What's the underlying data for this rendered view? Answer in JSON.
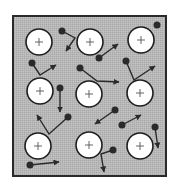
{
  "diagram": {
    "colors": {
      "background": "#ffffff",
      "lattice_fill": "#b4b4b4",
      "border": "#2a2a2a",
      "ion_fill": "#ffffff",
      "ion_stroke": "#1e1e1e",
      "electron": "#2a2a2a",
      "arrow": "#2a2a2a"
    },
    "frame": {
      "x": 13,
      "y": 16,
      "width": 153,
      "height": 160
    },
    "ion_symbol": "+",
    "ion_radius": 13,
    "ions": [
      {
        "id": "ion-1",
        "cx": 39,
        "cy": 42
      },
      {
        "id": "ion-2",
        "cx": 90,
        "cy": 42
      },
      {
        "id": "ion-3",
        "cx": 141,
        "cy": 40
      },
      {
        "id": "ion-4",
        "cx": 40,
        "cy": 91
      },
      {
        "id": "ion-5",
        "cx": 89,
        "cy": 94
      },
      {
        "id": "ion-6",
        "cx": 140,
        "cy": 93
      },
      {
        "id": "ion-7",
        "cx": 38,
        "cy": 146
      },
      {
        "id": "ion-8",
        "cx": 89,
        "cy": 145
      },
      {
        "id": "ion-9",
        "cx": 140,
        "cy": 146
      }
    ],
    "electron_radius": 3.5,
    "electrons": [
      {
        "id": "e-1",
        "x": 62,
        "y": 31,
        "path": [
          [
            62,
            31
          ],
          [
            75,
            38
          ],
          [
            66,
            51
          ]
        ]
      },
      {
        "id": "e-2",
        "x": 157,
        "y": 25,
        "path": []
      },
      {
        "id": "e-3",
        "x": 99,
        "y": 58,
        "path": [
          [
            99,
            58
          ],
          [
            118,
            44
          ]
        ]
      },
      {
        "id": "e-4",
        "x": 32,
        "y": 63,
        "path": [
          [
            32,
            63
          ],
          [
            40,
            75
          ],
          [
            56,
            65
          ]
        ]
      },
      {
        "id": "e-5",
        "x": 80,
        "y": 68,
        "path": [
          [
            80,
            68
          ],
          [
            97,
            81
          ],
          [
            119,
            82
          ]
        ]
      },
      {
        "id": "e-6",
        "x": 126,
        "y": 61,
        "path": [
          [
            126,
            61
          ],
          [
            134,
            80
          ],
          [
            155,
            66
          ]
        ]
      },
      {
        "id": "e-7",
        "x": 60,
        "y": 88,
        "path": [
          [
            60,
            88
          ],
          [
            60,
            112
          ]
        ]
      },
      {
        "id": "e-8",
        "x": 115,
        "y": 110,
        "path": [
          [
            115,
            110
          ],
          [
            95,
            124
          ]
        ]
      },
      {
        "id": "e-9",
        "x": 68,
        "y": 117,
        "path": [
          [
            68,
            117
          ],
          [
            49,
            134
          ],
          [
            37,
            115
          ]
        ]
      },
      {
        "id": "e-10",
        "x": 122,
        "y": 125,
        "path": [
          [
            122,
            125
          ],
          [
            141,
            115
          ]
        ]
      },
      {
        "id": "e-11",
        "x": 155,
        "y": 127,
        "path": [
          [
            155,
            127
          ],
          [
            158,
            148
          ]
        ]
      },
      {
        "id": "e-12",
        "x": 113,
        "y": 150,
        "path": [
          [
            113,
            150
          ],
          [
            101,
            154
          ],
          [
            104,
            172
          ]
        ]
      },
      {
        "id": "e-13",
        "x": 30,
        "y": 165,
        "path": [
          [
            30,
            165
          ],
          [
            59,
            162
          ]
        ]
      }
    ]
  }
}
